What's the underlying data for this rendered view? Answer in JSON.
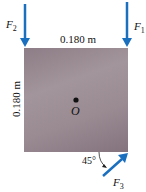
{
  "diagram": {
    "plate": {
      "shape": "square",
      "color": "#978890"
    },
    "dimensions": {
      "width_label": "0.180 m",
      "height_label": "0.180 m"
    },
    "point": {
      "label": "O"
    },
    "forces": [
      {
        "name": "F",
        "sub": "2",
        "direction": "down",
        "position": "top-left corner",
        "color": "#1a6fbf"
      },
      {
        "name": "F",
        "sub": "1",
        "direction": "down",
        "position": "top-right corner",
        "color": "#1a6fbf"
      },
      {
        "name": "F",
        "sub": "3",
        "direction": "up-right at 45°",
        "position": "bottom-right corner",
        "color": "#1a6fbf"
      }
    ],
    "angle_label": "45°"
  }
}
